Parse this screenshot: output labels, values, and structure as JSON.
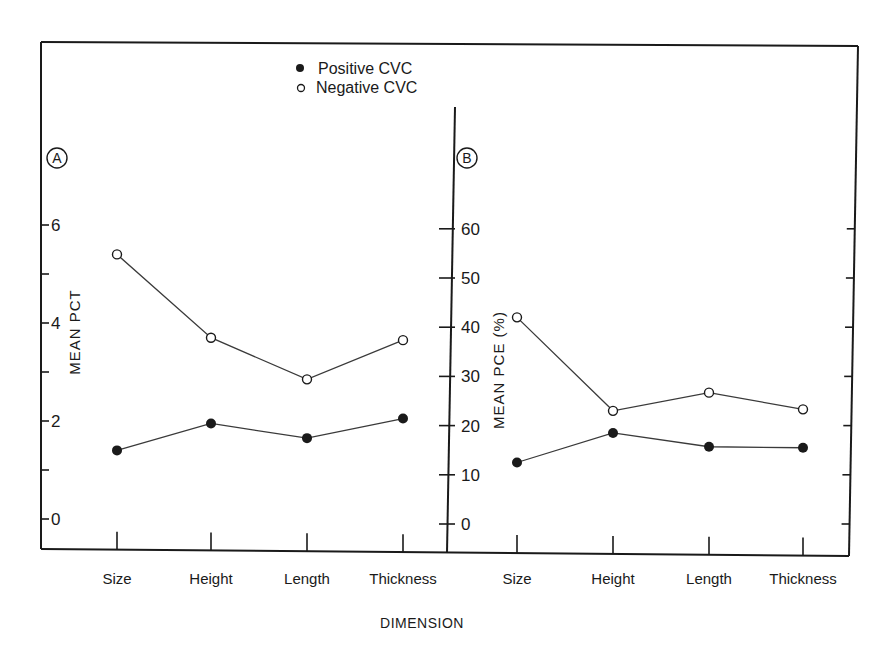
{
  "chart_data": [
    {
      "panel": "A",
      "type": "line",
      "ylabel": "MEAN PCT",
      "xlabel": "DIMENSION",
      "categories": [
        "Size",
        "Height",
        "Length",
        "Thickness"
      ],
      "ylim": [
        -0.5,
        7
      ],
      "yticks": [
        0,
        2,
        4,
        6
      ],
      "ytick_labels": [
        "0",
        "2",
        "4",
        "6"
      ],
      "minor_ticks": [
        1,
        3,
        5
      ],
      "grid": false,
      "series": [
        {
          "name": "Positive CVC",
          "marker": "filled-circle",
          "values": [
            1.4,
            1.95,
            1.65,
            2.05
          ]
        },
        {
          "name": "Negative CVC",
          "marker": "open-circle",
          "values": [
            5.4,
            3.7,
            2.85,
            3.65
          ]
        }
      ]
    },
    {
      "panel": "B",
      "type": "line",
      "ylabel": "MEAN PCE (%)",
      "xlabel": "DIMENSION",
      "categories": [
        "Size",
        "Height",
        "Length",
        "Thickness"
      ],
      "ylim": [
        -5,
        70
      ],
      "yticks": [
        0,
        10,
        20,
        30,
        40,
        50,
        60
      ],
      "ytick_labels": [
        "0",
        "10",
        "20",
        "30",
        "40",
        "50",
        "60"
      ],
      "grid": false,
      "series": [
        {
          "name": "Positive CVC",
          "marker": "filled-circle",
          "values": [
            12.5,
            18.5,
            15.7,
            15.5
          ]
        },
        {
          "name": "Negative CVC",
          "marker": "open-circle",
          "values": [
            42,
            23,
            26.7,
            23.3
          ]
        }
      ]
    }
  ],
  "legend": {
    "position": "top-center",
    "items": [
      {
        "label": "Positive CVC",
        "marker": "filled-circle"
      },
      {
        "label": "Negative CVC",
        "marker": "open-circle"
      }
    ]
  },
  "panels": {
    "a": {
      "badge": "A",
      "ylabel": "MEAN PCT"
    },
    "b": {
      "badge": "B",
      "ylabel": "MEAN PCE (%)"
    }
  },
  "xaxis": {
    "categories": [
      "Size",
      "Height",
      "Length",
      "Thickness"
    ],
    "title": "DIMENSION"
  },
  "colors": {
    "ink": "#1a1a1a",
    "line": "#3a3a3a",
    "background": "#ffffff"
  }
}
